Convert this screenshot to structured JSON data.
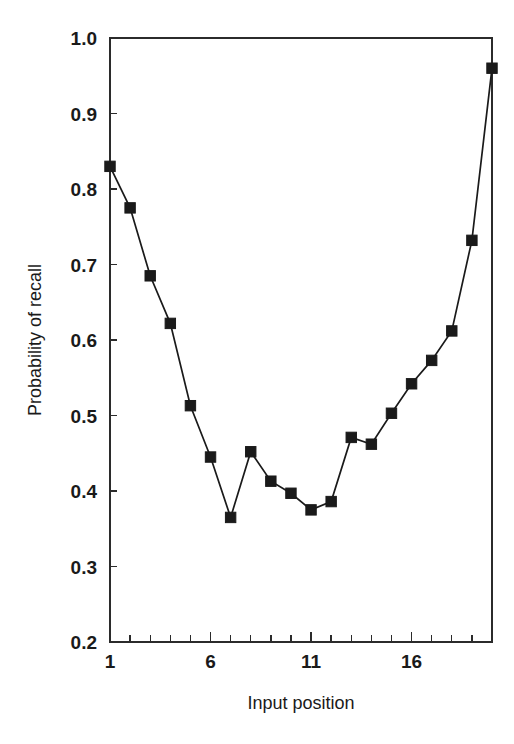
{
  "chart_data": {
    "type": "line",
    "title": "",
    "xlabel": "Input position",
    "ylabel": "Probability of recall",
    "xlim": [
      1,
      20
    ],
    "ylim": [
      0.2,
      1.0
    ],
    "grid": false,
    "legend": null,
    "marker": "filled-square",
    "x": [
      1,
      2,
      3,
      4,
      5,
      6,
      7,
      8,
      9,
      10,
      11,
      12,
      13,
      14,
      15,
      16,
      17,
      18,
      19,
      20
    ],
    "values": [
      0.83,
      0.775,
      0.685,
      0.622,
      0.513,
      0.445,
      0.365,
      0.452,
      0.413,
      0.397,
      0.375,
      0.386,
      0.471,
      0.462,
      0.503,
      0.542,
      0.573,
      0.612,
      0.732,
      0.96
    ],
    "x_ticks_major": [
      {
        "value": 1,
        "label": "1"
      },
      {
        "value": 6,
        "label": "6"
      },
      {
        "value": 11,
        "label": "11"
      },
      {
        "value": 16,
        "label": "16"
      }
    ],
    "x_ticks_minor": [
      2,
      3,
      4,
      5,
      7,
      8,
      9,
      10,
      12,
      13,
      14,
      15,
      17,
      18,
      19,
      20
    ],
    "y_ticks": [
      {
        "value": 1.0,
        "label": "1.0"
      },
      {
        "value": 0.9,
        "label": "0.9"
      },
      {
        "value": 0.8,
        "label": "0.8"
      },
      {
        "value": 0.7,
        "label": "0.7"
      },
      {
        "value": 0.6,
        "label": "0.6"
      },
      {
        "value": 0.5,
        "label": "0.5"
      },
      {
        "value": 0.4,
        "label": "0.4"
      },
      {
        "value": 0.3,
        "label": "0.3"
      },
      {
        "value": 0.2,
        "label": "0.2"
      }
    ],
    "colors": {
      "line": "#1a1a1a",
      "marker": "#1a1a1a",
      "axis": "#2b2b2b",
      "background": "#ffffff"
    }
  },
  "axis": {
    "x_title": "Input position",
    "y_title": "Probability of recall"
  }
}
